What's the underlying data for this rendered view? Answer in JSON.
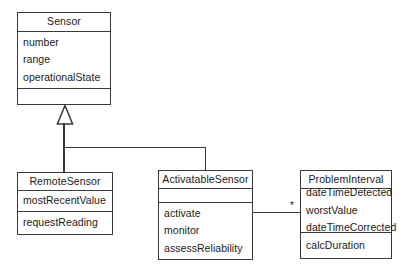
{
  "diagram": {
    "background_color": "#ffffff",
    "line_color": "#3a3a3a",
    "text_color": "#1a1a1a"
  },
  "classes": [
    {
      "id": "sensor",
      "name": "Sensor",
      "attributes": [
        "number",
        "range",
        "operationalState"
      ],
      "operations": []
    },
    {
      "id": "remote_sensor",
      "name": "RemoteSensor",
      "attributes": [
        "mostRecentValue"
      ],
      "operations": [
        "requestReading"
      ]
    },
    {
      "id": "activatable_sensor",
      "name": "ActivatableSensor",
      "attributes": [],
      "operations": [
        "activate",
        "monitor",
        "assessReliability"
      ]
    },
    {
      "id": "problem_interval",
      "name": "ProblemInterval",
      "attributes": [
        "dateTimeDetected",
        "worstValue",
        "dateTimeCorrected"
      ],
      "operations": [
        "calcDuration"
      ]
    }
  ],
  "relationships": [
    {
      "id": "gen-remote",
      "type": "generalization",
      "from": "RemoteSensor",
      "to": "Sensor"
    },
    {
      "id": "gen-activatable",
      "type": "generalization",
      "from": "ActivatableSensor",
      "to": "Sensor"
    },
    {
      "id": "assoc-problem",
      "type": "association",
      "from": "ActivatableSensor",
      "to": "ProblemInterval",
      "target_multiplicity": "*"
    }
  ]
}
